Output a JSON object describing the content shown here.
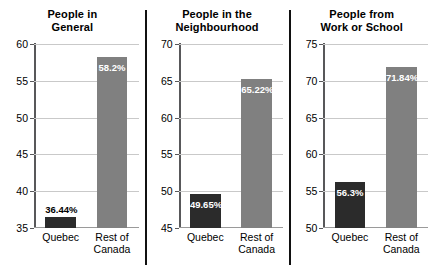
{
  "chart_data": [
    {
      "type": "bar",
      "title": "People in\nGeneral",
      "categories": [
        "Quebec",
        "Rest of\nCanada"
      ],
      "values": [
        36.44,
        58.2
      ],
      "value_labels": [
        "36.44%",
        "58.2%"
      ],
      "ylim": [
        35,
        60
      ],
      "yticks": [
        35,
        40,
        45,
        50,
        55,
        60
      ],
      "ytick_labels": [
        "35",
        "40",
        "45",
        "50",
        "55",
        "60"
      ],
      "xlabel": "",
      "ylabel": "",
      "grid": true,
      "legend": "none",
      "bar_colors": [
        "#2b2b2b",
        "#808080"
      ],
      "label_placement": [
        "outside",
        "inside"
      ]
    },
    {
      "type": "bar",
      "title": "People in the\nNeighbourhood",
      "categories": [
        "Quebec",
        "Rest of\nCanada"
      ],
      "values": [
        49.65,
        65.22
      ],
      "value_labels": [
        "49.65%",
        "65.22%"
      ],
      "ylim": [
        45,
        70
      ],
      "yticks": [
        45,
        50,
        55,
        60,
        65,
        70
      ],
      "ytick_labels": [
        "45",
        "50",
        "55",
        "60",
        "65",
        "70"
      ],
      "xlabel": "",
      "ylabel": "",
      "grid": true,
      "legend": "none",
      "bar_colors": [
        "#2b2b2b",
        "#808080"
      ],
      "label_placement": [
        "inside",
        "inside"
      ]
    },
    {
      "type": "bar",
      "title": "People from\nWork or School",
      "categories": [
        "Quebec",
        "Rest of\nCanada"
      ],
      "values": [
        56.3,
        71.84
      ],
      "value_labels": [
        "56.3%",
        "71.84%"
      ],
      "ylim": [
        50,
        75
      ],
      "yticks": [
        50,
        55,
        60,
        65,
        70,
        75
      ],
      "ytick_labels": [
        "50",
        "55",
        "60",
        "65",
        "70",
        "75"
      ],
      "xlabel": "",
      "ylabel": "",
      "grid": true,
      "legend": "none",
      "bar_colors": [
        "#2b2b2b",
        "#808080"
      ],
      "label_placement": [
        "inside",
        "inside"
      ]
    }
  ]
}
